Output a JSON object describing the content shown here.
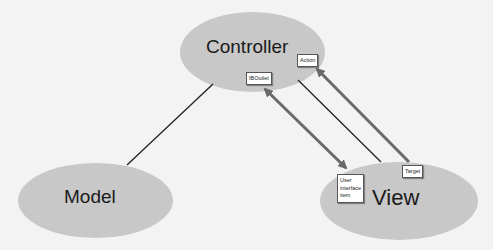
{
  "diagram": {
    "colors": {
      "background": "#f3f3f3",
      "node_fill": "#c8c8c8",
      "text": "#1a1a1a",
      "plain_link": "#222222",
      "arrow_link": "#6a6a6a"
    },
    "nodes": {
      "controller": {
        "label": "Controller"
      },
      "model": {
        "label": "Model"
      },
      "view": {
        "label": "View"
      }
    },
    "tags": {
      "outlet": {
        "label": "IBOutlet"
      },
      "action": {
        "label": "Action"
      },
      "target": {
        "label": "Target"
      },
      "ui_item": {
        "line1": "User",
        "line2": "interface",
        "line3": "item"
      }
    },
    "links": [
      {
        "from": "model",
        "to": "controller",
        "style": "plain"
      },
      {
        "from": "controller",
        "to": "view",
        "style": "plain"
      },
      {
        "from": "outlet",
        "to": "ui_item",
        "style": "double-arrow"
      },
      {
        "from": "target",
        "to": "action",
        "style": "arrow"
      }
    ]
  }
}
